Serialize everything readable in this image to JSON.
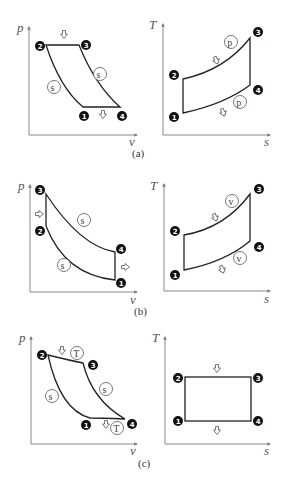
{
  "panels": [
    {
      "id": "a",
      "caption": "(a)",
      "pv": {
        "x_label": "v",
        "y_label": "p",
        "points": [
          {
            "n": "1",
            "label": "❶"
          },
          {
            "n": "2",
            "label": "❷"
          },
          {
            "n": "3",
            "label": "❸"
          },
          {
            "n": "4",
            "label": "❹"
          }
        ],
        "process_labels": [
          "s",
          "s"
        ]
      },
      "ts": {
        "x_label": "s",
        "y_label": "T",
        "points": [
          {
            "n": "1",
            "label": "❶"
          },
          {
            "n": "2",
            "label": "❷"
          },
          {
            "n": "3",
            "label": "❸"
          },
          {
            "n": "4",
            "label": "❹"
          }
        ],
        "process_labels": [
          "p",
          "p"
        ]
      }
    },
    {
      "id": "b",
      "caption": "(b)",
      "pv": {
        "x_label": "v",
        "y_label": "p",
        "points": [
          {
            "n": "1",
            "label": "❶"
          },
          {
            "n": "2",
            "label": "❷"
          },
          {
            "n": "3",
            "label": "❸"
          },
          {
            "n": "4",
            "label": "❹"
          }
        ],
        "process_labels": [
          "s",
          "s"
        ]
      },
      "ts": {
        "x_label": "s",
        "y_label": "T",
        "points": [
          {
            "n": "1",
            "label": "❶"
          },
          {
            "n": "2",
            "label": "❷"
          },
          {
            "n": "3",
            "label": "❸"
          },
          {
            "n": "4",
            "label": "❹"
          }
        ],
        "process_labels": [
          "v",
          "v"
        ]
      }
    },
    {
      "id": "c",
      "caption": "(c)",
      "pv": {
        "x_label": "v",
        "y_label": "p",
        "points": [
          {
            "n": "1",
            "label": "❶"
          },
          {
            "n": "2",
            "label": "❷"
          },
          {
            "n": "3",
            "label": "❸"
          },
          {
            "n": "4",
            "label": "❹"
          }
        ],
        "process_labels": [
          "s",
          "s",
          "T",
          "T"
        ]
      },
      "ts": {
        "x_label": "s",
        "y_label": "T",
        "points": [
          {
            "n": "1",
            "label": "❶"
          },
          {
            "n": "2",
            "label": "❷"
          },
          {
            "n": "3",
            "label": "❸"
          },
          {
            "n": "4",
            "label": "❹"
          }
        ],
        "process_labels": []
      }
    }
  ]
}
